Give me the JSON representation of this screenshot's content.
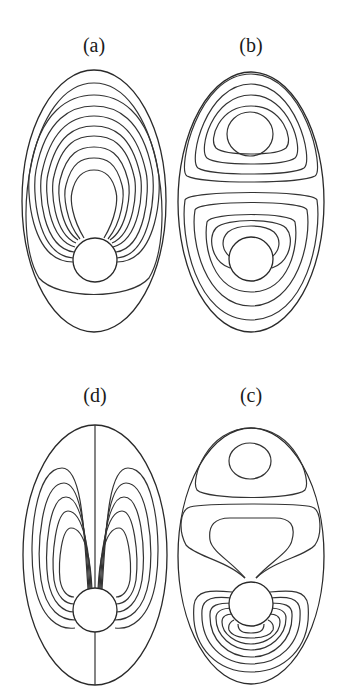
{
  "figure": {
    "panels": [
      {
        "id": "a",
        "label": "(a)",
        "description": "Nested closed contours around upper region, converging onto sphere; ellipse boundary"
      },
      {
        "id": "b",
        "label": "(b)",
        "description": "Two vortex cells: upper cell with concentric loops, lower cell wrapping sphere"
      },
      {
        "id": "d",
        "label": "(d)",
        "description": "Symmetric dipole-like contour lobes on each side of vertical axis line through sphere"
      },
      {
        "id": "c",
        "label": "(c)",
        "description": "Upper small vortex, middle region, dense contours below sphere"
      }
    ]
  }
}
